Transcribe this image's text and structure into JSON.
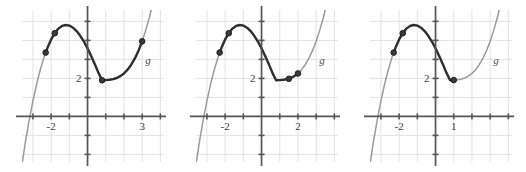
{
  "figure": {
    "background": "#ffffff",
    "width": 526,
    "height": 172,
    "panel_count": 3
  },
  "colors": {
    "grid": "#e2e2e4",
    "axis": "#555557",
    "curve_light": "#9a9a9c",
    "curve_bold": "#2f2f31",
    "point_fill": "#3a3a3c",
    "point_stroke": "#1e1e20",
    "text": "#3d3d3d"
  },
  "chart_data": [
    {
      "type": "line",
      "title": "",
      "xlabel": "",
      "ylabel": "",
      "function_label": "g",
      "xlim": [
        -3.6,
        4.2
      ],
      "ylim": [
        -2.4,
        5.6
      ],
      "grid": true,
      "grid_step": 1,
      "x_tick_labels": [
        {
          "x": -2,
          "text": "-2"
        },
        {
          "x": 3,
          "text": "3"
        }
      ],
      "y_tick_labels": [
        {
          "y": 2,
          "text": "2"
        }
      ],
      "curve": {
        "expression": "g(x) = 0.32*(x+3)*(x-0.8)*(x-0.8) + 1.9",
        "x": [
          -3.6,
          -3.4,
          -3.2,
          -3.0,
          -2.8,
          -2.6,
          -2.4,
          -2.3,
          -2.2,
          -2.0,
          -1.8,
          -1.6,
          -1.4,
          -1.2,
          -1.0,
          -0.8,
          -0.6,
          -0.4,
          -0.2,
          0.0,
          0.2,
          0.4,
          0.6,
          0.8,
          1.0,
          1.2,
          1.4,
          1.6,
          1.8,
          2.0,
          2.2,
          2.4,
          2.6,
          2.8,
          3.0,
          3.2,
          3.4,
          3.6,
          3.8,
          4.0
        ],
        "y": [
          -2.51,
          -1.28,
          -0.17,
          0.82,
          1.69,
          2.44,
          3.08,
          3.36,
          3.61,
          4.05,
          4.38,
          4.62,
          4.76,
          4.81,
          4.78,
          4.67,
          4.49,
          4.24,
          3.94,
          3.58,
          3.18,
          2.75,
          2.29,
          1.9,
          1.91,
          1.93,
          1.96,
          2.02,
          2.12,
          2.26,
          2.46,
          2.72,
          3.05,
          3.46,
          3.95,
          4.54,
          5.22,
          6.01,
          6.92,
          7.95
        ]
      },
      "highlighted_segment": {
        "x_from": -2.3,
        "x_to": 3.0,
        "style": "bold"
      },
      "points": [
        {
          "x": -2.3,
          "y": 3.36,
          "label": ""
        },
        {
          "x": -1.8,
          "y": 4.38,
          "label": ""
        },
        {
          "x": 0.8,
          "y": 1.9,
          "label": ""
        },
        {
          "x": 3.0,
          "y": 3.95,
          "label": ""
        }
      ]
    },
    {
      "type": "line",
      "title": "",
      "xlabel": "",
      "ylabel": "",
      "function_label": "g",
      "xlim": [
        -3.6,
        4.2
      ],
      "ylim": [
        -2.4,
        5.6
      ],
      "grid": true,
      "grid_step": 1,
      "x_tick_labels": [
        {
          "x": -2,
          "text": "-2"
        },
        {
          "x": 2,
          "text": "2"
        }
      ],
      "y_tick_labels": [
        {
          "y": 2,
          "text": "2"
        }
      ],
      "curve": {
        "expression": "g(x) = 0.32*(x+3)*(x-0.8)*(x-0.8) + 1.9",
        "x": [
          -3.6,
          -3.4,
          -3.2,
          -3.0,
          -2.8,
          -2.6,
          -2.4,
          -2.3,
          -2.2,
          -2.0,
          -1.8,
          -1.6,
          -1.4,
          -1.2,
          -1.0,
          -0.8,
          -0.6,
          -0.4,
          -0.2,
          0.0,
          0.2,
          0.4,
          0.6,
          0.8,
          1.0,
          1.2,
          1.4,
          1.6,
          1.8,
          2.0,
          2.2,
          2.4,
          2.6,
          2.8,
          3.0,
          3.2,
          3.4,
          3.6,
          3.8,
          4.0
        ],
        "y": [
          -2.51,
          -1.28,
          -0.17,
          0.82,
          1.69,
          2.44,
          3.08,
          3.36,
          3.61,
          4.05,
          4.38,
          4.62,
          4.76,
          4.81,
          4.78,
          4.67,
          4.49,
          4.24,
          3.94,
          3.58,
          3.18,
          2.75,
          2.29,
          1.9,
          1.91,
          1.93,
          1.96,
          2.02,
          2.12,
          2.26,
          2.46,
          2.72,
          3.05,
          3.46,
          3.95,
          4.54,
          5.22,
          6.01,
          6.92,
          7.95
        ]
      },
      "highlighted_segment": {
        "x_from": -2.3,
        "x_to": 2.0,
        "style": "bold"
      },
      "points": [
        {
          "x": -2.3,
          "y": 3.36,
          "label": ""
        },
        {
          "x": -1.8,
          "y": 4.38,
          "label": ""
        },
        {
          "x": 1.5,
          "y": 1.98,
          "label": ""
        },
        {
          "x": 2.0,
          "y": 2.26,
          "label": ""
        }
      ]
    },
    {
      "type": "line",
      "title": "",
      "xlabel": "",
      "ylabel": "",
      "function_label": "g",
      "xlim": [
        -3.6,
        4.2
      ],
      "ylim": [
        -2.4,
        5.6
      ],
      "grid": true,
      "grid_step": 1,
      "x_tick_labels": [
        {
          "x": -2,
          "text": "-2"
        },
        {
          "x": 1,
          "text": "1"
        }
      ],
      "y_tick_labels": [
        {
          "y": 2,
          "text": "2"
        }
      ],
      "curve": {
        "expression": "g(x) = 0.32*(x+3)*(x-0.8)*(x-0.8) + 1.9",
        "x": [
          -3.6,
          -3.4,
          -3.2,
          -3.0,
          -2.8,
          -2.6,
          -2.4,
          -2.3,
          -2.2,
          -2.0,
          -1.8,
          -1.6,
          -1.4,
          -1.2,
          -1.0,
          -0.8,
          -0.6,
          -0.4,
          -0.2,
          0.0,
          0.2,
          0.4,
          0.6,
          0.8,
          1.0,
          1.2,
          1.4,
          1.6,
          1.8,
          2.0,
          2.2,
          2.4,
          2.6,
          2.8,
          3.0,
          3.2,
          3.4,
          3.6,
          3.8,
          4.0
        ],
        "y": [
          -2.51,
          -1.28,
          -0.17,
          0.82,
          1.69,
          2.44,
          3.08,
          3.36,
          3.61,
          4.05,
          4.38,
          4.62,
          4.76,
          4.81,
          4.78,
          4.67,
          4.49,
          4.24,
          3.94,
          3.58,
          3.18,
          2.75,
          2.29,
          1.9,
          1.91,
          1.93,
          1.96,
          2.02,
          2.12,
          2.26,
          2.46,
          2.72,
          3.05,
          3.46,
          3.95,
          4.54,
          5.22,
          6.01,
          6.92,
          7.95
        ]
      },
      "highlighted_segment": {
        "x_from": -2.3,
        "x_to": 1.0,
        "style": "bold"
      },
      "points": [
        {
          "x": -2.3,
          "y": 3.36,
          "label": ""
        },
        {
          "x": -1.8,
          "y": 4.38,
          "label": ""
        },
        {
          "x": 1.0,
          "y": 1.91,
          "label": ""
        }
      ]
    }
  ]
}
